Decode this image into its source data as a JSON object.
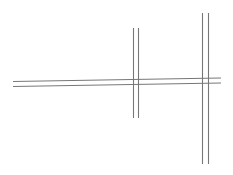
{
  "canvas": {
    "width": 233,
    "height": 175,
    "background": "#ffffff"
  },
  "style": {
    "road_edge_color": "#777777",
    "road_fill_color": "#ffffff"
  },
  "roads": [
    {
      "id": "horizontal-road",
      "orientation": "horizontal",
      "edges": [
        {
          "x1": 13,
          "y1": 81.5,
          "x2": 221,
          "y2": 78
        },
        {
          "x1": 13,
          "y1": 86.5,
          "x2": 221,
          "y2": 83
        }
      ]
    },
    {
      "id": "vertical-road-middle",
      "orientation": "vertical",
      "edges": [
        {
          "x1": 133.5,
          "y1": 28,
          "x2": 133.5,
          "y2": 118
        },
        {
          "x1": 138.5,
          "y1": 28,
          "x2": 138.5,
          "y2": 118
        }
      ]
    },
    {
      "id": "vertical-road-right",
      "orientation": "vertical",
      "edges": [
        {
          "x1": 202.5,
          "y1": 13,
          "x2": 202.5,
          "y2": 164
        },
        {
          "x1": 208.5,
          "y1": 13,
          "x2": 208.5,
          "y2": 164
        }
      ]
    }
  ],
  "intersections": [
    {
      "id": "intersection-middle",
      "x": 136,
      "y": 82
    },
    {
      "id": "intersection-right",
      "x": 205.5,
      "y": 80.5
    }
  ]
}
